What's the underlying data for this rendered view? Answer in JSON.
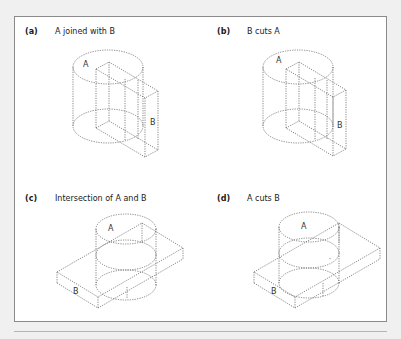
{
  "figure": {
    "panels": [
      {
        "id": "a",
        "tag": "(a)",
        "caption": "A joined with B",
        "shape_a": "A",
        "shape_b": "B"
      },
      {
        "id": "b",
        "tag": "(b)",
        "caption": "B cuts A",
        "shape_a": "A",
        "shape_b": "B"
      },
      {
        "id": "c",
        "tag": "(c)",
        "caption": "Intersection of A and B",
        "shape_a": "A",
        "shape_b": "B"
      },
      {
        "id": "d",
        "tag": "(d)",
        "caption": "A cuts B",
        "shape_a": "A",
        "shape_b": "B"
      }
    ],
    "colors": {
      "background": "#f0f0f0",
      "frame_bg": "#ffffff",
      "frame_border": "#8a8a8a",
      "line": "#555555"
    }
  }
}
